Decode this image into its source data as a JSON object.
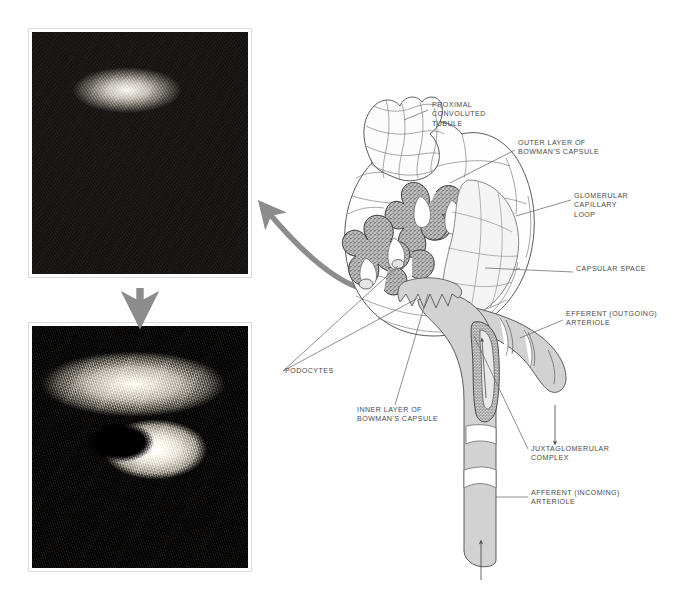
{
  "figure": {
    "kind": "anatomical-illustration",
    "background_color": "#ffffff",
    "label_color": "#4a4a4a",
    "diagram_fill_color": "#d2d2d2",
    "diagram_line_color": "#5a5a5a",
    "arrow_color": "#8c8c8c"
  },
  "panels": [
    {
      "name": "top-micrograph",
      "type": "scanning-electron-micrograph",
      "caption": "",
      "description": "Convoluted tubules seen in surface view",
      "frame_color": "#dcdcdc"
    },
    {
      "name": "bottom-micrograph",
      "type": "scanning-electron-micrograph",
      "caption": "",
      "description": "Cut tubule showing lumen and brush-border cells",
      "frame_color": "#dcdcdc"
    }
  ],
  "arrows": [
    {
      "name": "curved-arrow-to-top-photo",
      "style": "thick-curved",
      "direction": "up-left",
      "color": "#8c8c8c"
    },
    {
      "name": "arrow-between-photos",
      "style": "thick-straight",
      "direction": "down",
      "color": "#8c8c8c"
    },
    {
      "name": "efferent-flow-arrow",
      "style": "thin-straight",
      "direction": "down",
      "color": "#4a4a4a"
    },
    {
      "name": "afferent-flow-arrow",
      "style": "thin-straight",
      "direction": "up",
      "color": "#4a4a4a"
    },
    {
      "name": "juxtaglomerular-inner-arrow",
      "style": "thin-straight",
      "direction": "up",
      "color": "#4a4a4a"
    }
  ],
  "labels": [
    {
      "id": "proximal-convoluted-tubule",
      "lines": [
        "PROXIMAL",
        "CONVOLUTED",
        "TUBULE"
      ],
      "x": 432,
      "y": 107,
      "anchor": "start"
    },
    {
      "id": "outer-layer-bowmans-capsule",
      "lines": [
        "OUTER LAYER OF",
        "BOWMAN'S CAPSULE"
      ],
      "x": 518,
      "y": 145,
      "anchor": "start"
    },
    {
      "id": "glomerular-capillary-loop",
      "lines": [
        "GLOMERULAR",
        "CAPILLARY",
        "LOOP"
      ],
      "x": 574,
      "y": 198,
      "anchor": "start"
    },
    {
      "id": "capsular-space",
      "lines": [
        "CAPSULAR SPACE"
      ],
      "x": 576,
      "y": 271,
      "anchor": "start"
    },
    {
      "id": "efferent-outgoing-arteriole",
      "lines": [
        "EFFERENT (OUTGOING)",
        "ARTERIOLE"
      ],
      "x": 566,
      "y": 316,
      "anchor": "start"
    },
    {
      "id": "podocytes",
      "lines": [
        "PODOCYTES"
      ],
      "x": 285,
      "y": 373,
      "anchor": "start"
    },
    {
      "id": "inner-layer-bowmans-capsule",
      "lines": [
        "INNER LAYER OF",
        "BOWMAN'S CAPSULE"
      ],
      "x": 357,
      "y": 412,
      "anchor": "start"
    },
    {
      "id": "juxtaglomerular-complex",
      "lines": [
        "JUXTAGLOMERULAR",
        "COMPLEX",
        ""
      ],
      "x": 531,
      "y": 451,
      "anchor": "start"
    },
    {
      "id": "afferent-incoming-arteriole",
      "lines": [
        "AFFERENT (INCOMING)",
        "ARTERIOLE"
      ],
      "x": 531,
      "y": 495,
      "anchor": "start"
    }
  ]
}
